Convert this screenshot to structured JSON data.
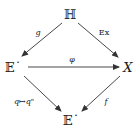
{
  "diagram": {
    "type": "commutative-diagram",
    "nodes": [
      {
        "id": "H",
        "label": "ℍ",
        "x": 70,
        "y": 14
      },
      {
        "id": "E1",
        "label": "𝔼˙",
        "x": 12,
        "y": 67
      },
      {
        "id": "X",
        "label": "X",
        "x": 128,
        "y": 67
      },
      {
        "id": "E2",
        "label": "𝔼˙",
        "x": 71,
        "y": 120
      }
    ],
    "edges": [
      {
        "from": "H",
        "to": "E1",
        "label": "g"
      },
      {
        "from": "H",
        "to": "X",
        "label": "Ex"
      },
      {
        "from": "E1",
        "to": "X",
        "label": "φ"
      },
      {
        "from": "E1",
        "to": "E2",
        "label": "q↦qⁿ"
      },
      {
        "from": "X",
        "to": "E2",
        "label": "f"
      }
    ]
  },
  "nodes": {
    "H": "ℍ",
    "E_top": "𝔼˙",
    "X": "X",
    "E_bottom": "𝔼˙"
  },
  "labels": {
    "g": "g",
    "Ex": "Ex",
    "phi": "φ",
    "power": "q↦qⁿ",
    "f": "f"
  },
  "colors": {
    "stroke": "#333333",
    "text": "#1a1a1a",
    "background": "#ffffff"
  }
}
